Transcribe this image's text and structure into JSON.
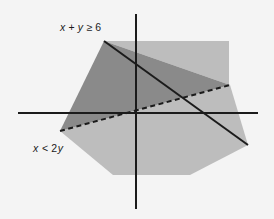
{
  "figure": {
    "background_color": "#f4f4f4",
    "width": 274,
    "height": 219
  },
  "axes": {
    "origin": {
      "x": 136,
      "y": 113
    },
    "x_axis": {
      "name": "x-axis",
      "x1": 18,
      "y1": 113,
      "x2": 258,
      "y2": 113
    },
    "y_axis": {
      "name": "y-axis",
      "x1": 136,
      "y1": 14,
      "x2": 136,
      "y2": 209
    },
    "color": "#1b1b1b",
    "stroke_width": 2
  },
  "chart_data": {
    "type": "line",
    "xlabel": "x",
    "ylabel": "y",
    "grid": false,
    "legend_position": "inline-annotations",
    "boundaries": [
      {
        "name": "boundary-x-plus-y",
        "equation": "x + y = 6",
        "inequality": "x + y ≥ 6",
        "style": "solid",
        "included": true,
        "slope": -1,
        "color": "#1b1b1b",
        "pixel_from": {
          "x": 104,
          "y": 41
        },
        "pixel_to": {
          "x": 248,
          "y": 145
        },
        "x_intercept_px": 202
      },
      {
        "name": "boundary-x-equals-2y",
        "equation": "x = 2y",
        "inequality": "x < 2y",
        "style": "dashed",
        "included": false,
        "slope": 0.5,
        "color": "#1b1b1b",
        "pixel_from": {
          "x": 60,
          "y": 131
        },
        "pixel_to": {
          "x": 230,
          "y": 85
        },
        "passes_through_origin": true
      }
    ],
    "regions": [
      {
        "name": "region-overlap",
        "description": "Solution set satisfying both inequalities",
        "shade": "dark",
        "color": "#8a8a8a",
        "points": [
          [
            104,
            41
          ],
          [
            230,
            85
          ],
          [
            60,
            131
          ]
        ]
      },
      {
        "name": "region-upper-right",
        "description": "Region satisfying x + y ≥ 6 only",
        "shade": "light",
        "color": "#bdbdbd",
        "points": [
          [
            104,
            41
          ],
          [
            229,
            41
          ],
          [
            229,
            85
          ],
          [
            230,
            85
          ]
        ]
      },
      {
        "name": "region-lower",
        "description": "Region satisfying x < 2y only",
        "shade": "light",
        "color": "#bdbdbd",
        "points": [
          [
            60,
            131
          ],
          [
            230,
            85
          ],
          [
            248,
            145
          ],
          [
            190,
            175
          ],
          [
            113,
            175
          ]
        ]
      }
    ]
  },
  "annotations": [
    {
      "name": "label-x-plus-y",
      "text": "x + y ≥ 6",
      "parts": {
        "var1": "x",
        "plus": "+",
        "var2": "y",
        "rel": "≥",
        "value": "6"
      },
      "x": 60,
      "y": 31
    },
    {
      "name": "label-x-less-2y",
      "text": "x < 2y",
      "parts": {
        "var1": "x",
        "rel": "<",
        "coeff": "2",
        "var2": "y"
      },
      "x": 33,
      "y": 152
    }
  ],
  "colors": {
    "background": "#f4f4f4",
    "axis": "#1b1b1b",
    "line": "#1b1b1b",
    "region_dark": "#8a8a8a",
    "region_light": "#bdbdbd",
    "text": "#1b1b1b"
  }
}
